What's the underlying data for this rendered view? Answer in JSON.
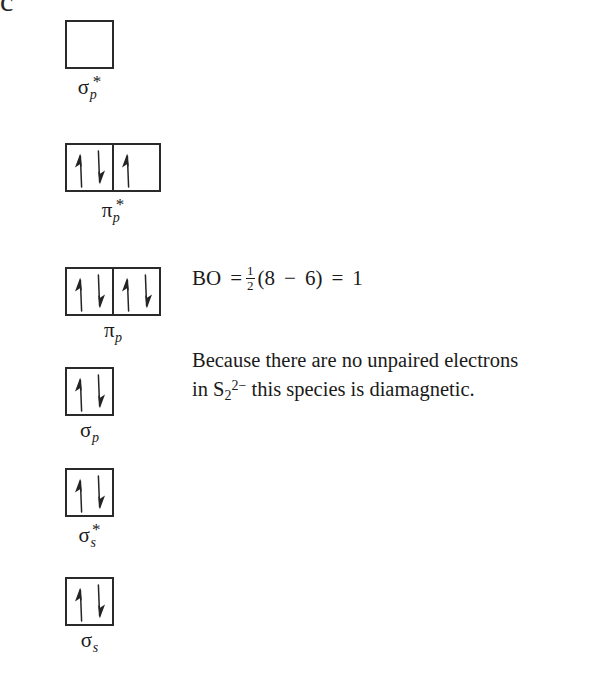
{
  "figure": {
    "corner_label": "c",
    "molecule": "S2^2-",
    "kind": "molecular-orbital-diagram"
  },
  "levels": [
    {
      "id": "sigma-p-star",
      "label_base": "σ",
      "label_sub": "p",
      "label_star": "*",
      "label_text": "σp*",
      "boxes": [
        {
          "electrons": []
        }
      ]
    },
    {
      "id": "pi-p-star",
      "label_base": "π",
      "label_sub": "p",
      "label_star": "*",
      "label_text": "πp*",
      "boxes": [
        {
          "electrons": [
            "up",
            "down"
          ]
        },
        {
          "electrons": [
            "up"
          ]
        }
      ]
    },
    {
      "id": "pi-p",
      "label_base": "π",
      "label_sub": "p",
      "label_star": "",
      "label_text": "πp",
      "boxes": [
        {
          "electrons": [
            "up",
            "down"
          ]
        },
        {
          "electrons": [
            "up",
            "down"
          ]
        }
      ]
    },
    {
      "id": "sigma-p",
      "label_base": "σ",
      "label_sub": "p",
      "label_star": "",
      "label_text": "σp",
      "boxes": [
        {
          "electrons": [
            "up",
            "down"
          ]
        }
      ]
    },
    {
      "id": "sigma-s-star",
      "label_base": "σ",
      "label_sub": "s",
      "label_star": "*",
      "label_text": "σs*",
      "boxes": [
        {
          "electrons": [
            "up",
            "down"
          ]
        }
      ]
    },
    {
      "id": "sigma-s",
      "label_base": "σ",
      "label_sub": "s",
      "label_star": "",
      "label_text": "σs",
      "boxes": [
        {
          "electrons": [
            "up",
            "down"
          ]
        }
      ]
    }
  ],
  "bond_order": {
    "prefix": "BO",
    "equals": "=",
    "fraction_numerator": "1",
    "fraction_denominator": "2",
    "open_paren": "(",
    "bonding_electrons": "8",
    "minus": "−",
    "antibonding_electrons": "6",
    "close_paren": ")",
    "equals2": "=",
    "result": "1",
    "full_text": "BO = 1/2 (8 − 6) = 1"
  },
  "note": {
    "line1": "Because there are no unpaired electrons",
    "line2_lead": "in S",
    "line2_sub": "2",
    "line2_sup": "2−",
    "line2_rest": " this species is diamagnetic.",
    "full_text": "Because there are no unpaired electrons in S2^2- this species is diamagnetic."
  },
  "colors": {
    "ink": "#1a1a1a",
    "box_stroke": "#2a2a2a",
    "background": "#ffffff"
  }
}
